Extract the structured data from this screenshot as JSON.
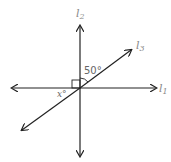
{
  "diagram": {
    "title": "",
    "lines": [
      {
        "id": "l1",
        "label": "l",
        "subscript": "1",
        "orientation": "horizontal"
      },
      {
        "id": "l2",
        "label": "l",
        "subscript": "2",
        "orientation": "vertical"
      },
      {
        "id": "l3",
        "label": "l",
        "subscript": "3",
        "orientation": "diagonal"
      }
    ],
    "angles": {
      "given": "50°",
      "unknown": "x°",
      "right_angle_marker": true
    },
    "colors": {
      "line": "#222222",
      "label": "#888888"
    }
  }
}
